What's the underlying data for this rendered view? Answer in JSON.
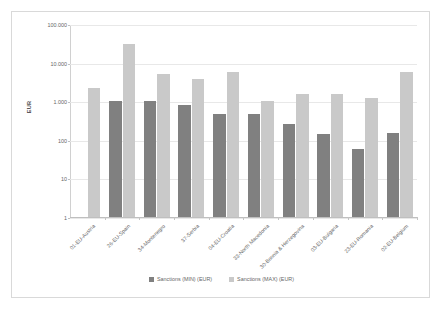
{
  "chart_data": {
    "type": "bar",
    "title": "",
    "xlabel": "",
    "ylabel": "EUR",
    "yscale": "log",
    "ylim": [
      1,
      100000
    ],
    "ytick_labels": [
      "100.000",
      "10.000",
      "1.000",
      "100",
      "10",
      "1"
    ],
    "ytick_values": [
      100000,
      10000,
      1000,
      100,
      10,
      1
    ],
    "grid": true,
    "legend_position": "bottom",
    "categories": [
      "01-EU-Austria",
      "26-EU-Spain",
      "34-Montenegro",
      "37-Serbia",
      "04-EU-Croatia",
      "33-North Macedonia",
      "30-Bosnia & Herzegovina",
      "03-EU-Bulgaria",
      "23-EU-Romania",
      "02-EU-Belgium"
    ],
    "series": [
      {
        "name": "Sanctions (MIN) (EUR)",
        "color": "#808080",
        "values": [
          null,
          1000,
          1000,
          800,
          480,
          480,
          250,
          145,
          57,
          150
        ]
      },
      {
        "name": "Sanctions (MAX) (EUR)",
        "color": "#c9c9c9",
        "values": [
          2200,
          30000,
          5000,
          3800,
          5800,
          1000,
          1500,
          1500,
          1180,
          5700
        ]
      }
    ]
  },
  "legend": {
    "items": [
      {
        "label": "Sanctions (MIN) (EUR)",
        "color": "#808080"
      },
      {
        "label": "Sanctions (MAX) (EUR)",
        "color": "#c9c9c9"
      }
    ]
  },
  "axis": {
    "y_title": "EUR"
  }
}
